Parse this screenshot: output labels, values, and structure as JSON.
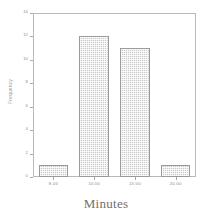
{
  "chart_data": {
    "type": "bar",
    "title": "",
    "categories": [
      "8.00",
      "10.00",
      "15.00",
      "20.00"
    ],
    "values": [
      1,
      12,
      11,
      1
    ],
    "xlabel": "Minutes",
    "ylabel": "Frequency",
    "ylim": [
      0,
      14
    ],
    "yticks": [
      0,
      2,
      4,
      6,
      8,
      10,
      12,
      14
    ],
    "ytick_labels": [
      "0",
      "2",
      "4",
      "6",
      "8",
      "10",
      "12",
      "14"
    ],
    "grid": false,
    "legend": null,
    "bar_fill": "#c8c8c8",
    "bar_edge": "#9a9a9a",
    "frame_color": "#b9b9b9",
    "axis_text_color": "#8d8d8d"
  }
}
